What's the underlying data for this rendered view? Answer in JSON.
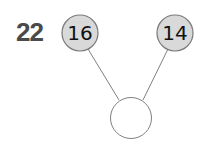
{
  "question": {
    "number": "22"
  },
  "number_bond": {
    "parts": [
      {
        "label": "16",
        "cx": 80,
        "cy": 33
      },
      {
        "label": "14",
        "cx": 175,
        "cy": 33
      }
    ],
    "whole": {
      "label": "",
      "cx": 131,
      "cy": 118
    },
    "colors": {
      "part_fill": "#d9d9d9",
      "stroke": "#808080",
      "whole_fill": "#ffffff"
    }
  }
}
